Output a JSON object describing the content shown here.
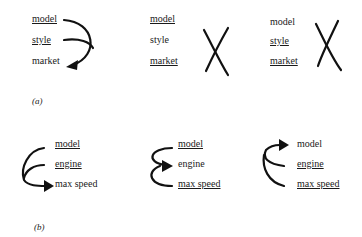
{
  "panel_a": {
    "caption": "(a)",
    "groups": [
      {
        "items": [
          {
            "label": "model",
            "underlined": true
          },
          {
            "label": "style",
            "underlined": true
          },
          {
            "label": "market",
            "underlined": false
          }
        ],
        "connector": "curved-arrow model and style to market"
      },
      {
        "items": [
          {
            "label": "model",
            "underlined": true
          },
          {
            "label": "style",
            "underlined": false
          },
          {
            "label": "market",
            "underlined": true
          }
        ],
        "connector": "cross mark"
      },
      {
        "items": [
          {
            "label": "model",
            "underlined": false
          },
          {
            "label": "style",
            "underlined": true
          },
          {
            "label": "market",
            "underlined": true
          }
        ],
        "connector": "cross mark"
      }
    ]
  },
  "panel_b": {
    "caption": "(b)",
    "groups": [
      {
        "items": [
          {
            "label": "model",
            "underlined": true
          },
          {
            "label": "engine",
            "underlined": true
          },
          {
            "label": "max speed",
            "underlined": false
          }
        ],
        "connector": "curved-arrow to max speed"
      },
      {
        "items": [
          {
            "label": "model",
            "underlined": true
          },
          {
            "label": "engine",
            "underlined": false
          },
          {
            "label": "max speed",
            "underlined": true
          }
        ],
        "connector": "curved-arrow to engine"
      },
      {
        "items": [
          {
            "label": "model",
            "underlined": false
          },
          {
            "label": "engine",
            "underlined": true
          },
          {
            "label": "max speed",
            "underlined": true
          }
        ],
        "connector": "curved-arrow to model"
      }
    ]
  }
}
